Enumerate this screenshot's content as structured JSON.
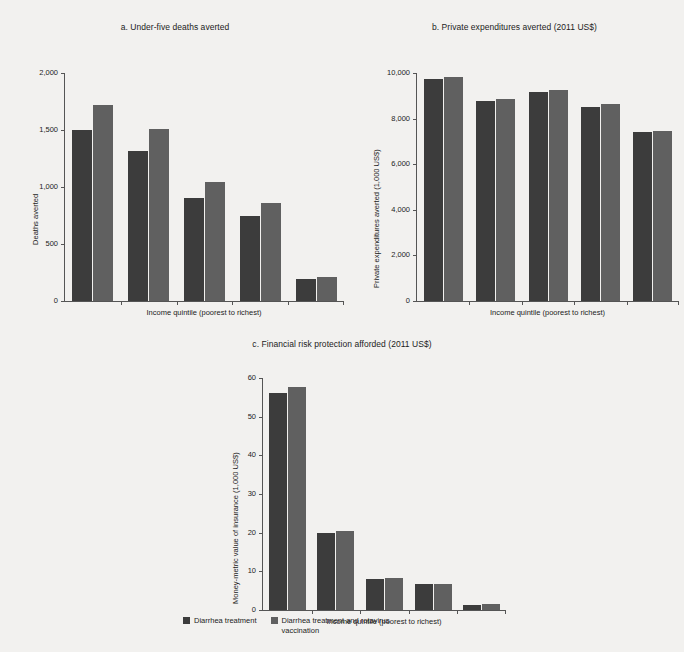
{
  "figure": {
    "background": "#f2f1ef",
    "series_colors": {
      "diarrhea_treatment": "#3c3c3c",
      "diarrhea_treatment_and_rotavirus": "#606060"
    }
  },
  "legend": {
    "position": "bottom-center",
    "items": [
      {
        "label": "Diarrhea treatment",
        "color": "#3c3c3c"
      },
      {
        "label": "Diarrhea treatment and rotavirus vaccination",
        "color": "#606060"
      }
    ]
  },
  "chart_data": [
    {
      "type": "bar",
      "panel": "a",
      "title": "a. Under-five deaths averted",
      "xlabel": "Income quintile (poorest to richest)",
      "ylabel": "Deaths averted",
      "categories": [
        "1",
        "2",
        "3",
        "4",
        "5"
      ],
      "ylim": [
        0,
        2000
      ],
      "yticks": [
        0,
        500,
        1000,
        1500,
        2000
      ],
      "ytick_labels": [
        "0",
        "500",
        "1,000",
        "1,500",
        "2,000"
      ],
      "grid": false,
      "series": [
        {
          "name": "Diarrhea treatment",
          "values": [
            1500,
            1320,
            900,
            750,
            190
          ]
        },
        {
          "name": "Diarrhea treatment and rotavirus vaccination",
          "values": [
            1720,
            1510,
            1040,
            860,
            215
          ]
        }
      ]
    },
    {
      "type": "bar",
      "panel": "b",
      "title": "b. Private expenditures averted (2011 US$)",
      "xlabel": "Income quintile (poorest to richest)",
      "ylabel": "Private expenditures averted (1,000 US$)",
      "categories": [
        "1",
        "2",
        "3",
        "4",
        "5"
      ],
      "ylim": [
        0,
        10000
      ],
      "yticks": [
        0,
        2000,
        4000,
        6000,
        8000,
        10000
      ],
      "ytick_labels": [
        "0",
        "2,000",
        "4,000",
        "6,000",
        "8,000",
        "10,000"
      ],
      "grid": false,
      "series": [
        {
          "name": "Diarrhea treatment",
          "values": [
            9750,
            8780,
            9180,
            8530,
            7400
          ]
        },
        {
          "name": "Diarrhea treatment and rotavirus vaccination",
          "values": [
            9820,
            8850,
            9250,
            8620,
            7460
          ]
        }
      ]
    },
    {
      "type": "bar",
      "panel": "c",
      "title": "c. Financial risk protection afforded (2011 US$)",
      "xlabel": "Income quintile (poorest to richest)",
      "ylabel": "Money-metric value of insurance (1,000 US$)",
      "categories": [
        "1",
        "2",
        "3",
        "4",
        "5"
      ],
      "ylim": [
        0,
        60
      ],
      "yticks": [
        0,
        10,
        20,
        30,
        40,
        50,
        60
      ],
      "ytick_labels": [
        "0",
        "10",
        "20",
        "30",
        "40",
        "50",
        "60"
      ],
      "grid": false,
      "series": [
        {
          "name": "Diarrhea treatment",
          "values": [
            56,
            19.8,
            7.9,
            6.6,
            1.4
          ]
        },
        {
          "name": "Diarrhea treatment and rotavirus vaccination",
          "values": [
            57.6,
            20.4,
            8.2,
            6.8,
            1.6
          ]
        }
      ]
    }
  ]
}
